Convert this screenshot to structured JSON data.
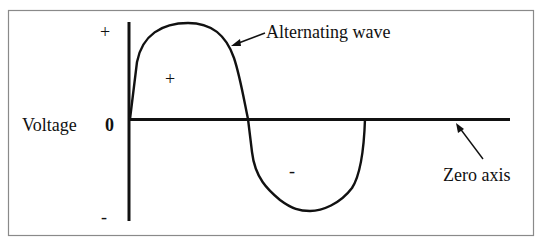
{
  "diagram": {
    "title": "Alternating wave",
    "y_axis_label": "Voltage",
    "y_axis_zero": "0",
    "y_axis_top": "+",
    "y_axis_bottom": "-",
    "positive_region_label": "+",
    "negative_region_label": "-",
    "wave_label": "Alternating wave",
    "zero_axis_label": "Zero axis",
    "colors": {
      "line": "#111111",
      "frame": "#8a8a8a",
      "background": "#ffffff"
    }
  }
}
